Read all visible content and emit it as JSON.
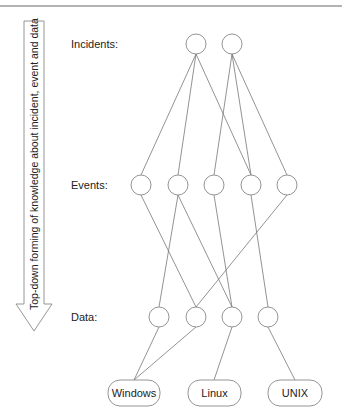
{
  "figure": {
    "arrow_label": "Top-down forming of knowledge about incident, event and data",
    "levels": {
      "incidents": {
        "label": "Incidents:",
        "y": 44,
        "nodes": [
          {
            "id": "I1",
            "x": 196
          },
          {
            "id": "I2",
            "x": 232
          }
        ]
      },
      "events": {
        "label": "Events:",
        "y": 185,
        "nodes": [
          {
            "id": "E1",
            "x": 141
          },
          {
            "id": "E2",
            "x": 178
          },
          {
            "id": "E3",
            "x": 214
          },
          {
            "id": "E4",
            "x": 251
          },
          {
            "id": "E5",
            "x": 287
          }
        ]
      },
      "data": {
        "label": "Data:",
        "y": 317,
        "nodes": [
          {
            "id": "D1",
            "x": 159
          },
          {
            "id": "D2",
            "x": 196
          },
          {
            "id": "D3",
            "x": 232
          },
          {
            "id": "D4",
            "x": 268
          }
        ]
      }
    },
    "sources": [
      {
        "id": "windows",
        "label": "Windows",
        "x": 108,
        "w": 52,
        "cx": 134
      },
      {
        "id": "linux",
        "label": "Linux",
        "x": 188,
        "w": 53,
        "cx": 214
      },
      {
        "id": "unix",
        "label": "UNIX",
        "x": 268,
        "w": 54,
        "cx": 295
      }
    ],
    "edges": [
      [
        "I1",
        "E1"
      ],
      [
        "I1",
        "E2"
      ],
      [
        "I1",
        "E4"
      ],
      [
        "I2",
        "E3"
      ],
      [
        "I2",
        "E4"
      ],
      [
        "I2",
        "E5"
      ],
      [
        "E1",
        "D2"
      ],
      [
        "E2",
        "D1"
      ],
      [
        "E2",
        "D3"
      ],
      [
        "E3",
        "D3"
      ],
      [
        "E4",
        "D4"
      ],
      [
        "E5",
        "D2"
      ],
      [
        "D1",
        "windows"
      ],
      [
        "D2",
        "windows"
      ],
      [
        "D3",
        "linux"
      ],
      [
        "D4",
        "unix"
      ]
    ]
  }
}
